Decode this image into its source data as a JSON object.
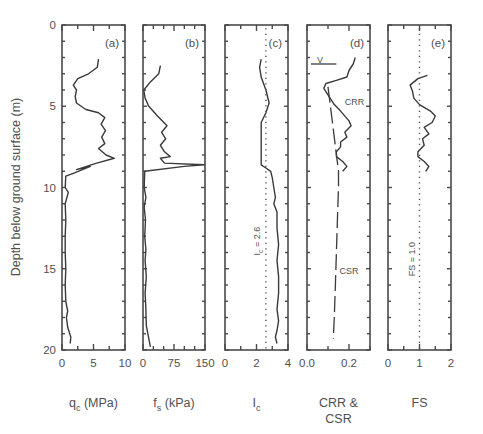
{
  "chart_data": {
    "type": "line",
    "ylabel": "Depth below ground surface  (m)",
    "ylim": [
      0,
      20
    ],
    "yticks": [
      0,
      5,
      10,
      15,
      20
    ],
    "y_inverted": true,
    "panels": [
      {
        "id": "a",
        "panel_label": "(a)",
        "xlabel_main": "q",
        "xlabel_sub": "c",
        "xlabel_unit": "(MPa)",
        "xlim": [
          0,
          10
        ],
        "xticks": [
          0,
          5,
          10
        ],
        "xtick_labels": [
          "0",
          "5",
          "10"
        ],
        "minor_step": 2.5,
        "series": [
          {
            "name": "qc",
            "style": "solid",
            "points": [
              [
                5.8,
                2.1
              ],
              [
                5.6,
                2.6
              ],
              [
                4.2,
                3.0
              ],
              [
                2.5,
                3.3
              ],
              [
                1.8,
                3.7
              ],
              [
                2.3,
                4.0
              ],
              [
                2.1,
                4.4
              ],
              [
                2.3,
                4.8
              ],
              [
                3.8,
                5.2
              ],
              [
                5.8,
                5.4
              ],
              [
                6.8,
                5.7
              ],
              [
                6.2,
                6.1
              ],
              [
                6.9,
                6.5
              ],
              [
                6.3,
                6.9
              ],
              [
                6.8,
                7.3
              ],
              [
                5.8,
                7.6
              ],
              [
                7.0,
                8.0
              ],
              [
                8.3,
                8.2
              ],
              [
                5.5,
                8.5
              ],
              [
                2.3,
                8.9
              ],
              [
                4.5,
                8.7
              ],
              [
                2.0,
                9.1
              ],
              [
                0.6,
                9.3
              ],
              [
                0.5,
                10.0
              ],
              [
                1.0,
                10.3
              ],
              [
                0.5,
                11.0
              ],
              [
                0.6,
                12.0
              ],
              [
                0.5,
                13.0
              ],
              [
                0.5,
                14.0
              ],
              [
                0.6,
                15.0
              ],
              [
                0.5,
                16.0
              ],
              [
                0.6,
                17.0
              ],
              [
                0.9,
                17.6
              ],
              [
                0.7,
                18.0
              ],
              [
                0.9,
                18.6
              ],
              [
                1.4,
                19.2
              ],
              [
                1.3,
                19.6
              ]
            ]
          }
        ]
      },
      {
        "id": "b",
        "panel_label": "(b)",
        "xlabel_main": "f",
        "xlabel_sub": "s",
        "xlabel_unit": "(kPa)",
        "xlim": [
          0,
          150
        ],
        "xticks": [
          0,
          75,
          150
        ],
        "xtick_labels": [
          "0",
          "75",
          "150"
        ],
        "minor_step": 25,
        "series": [
          {
            "name": "fs",
            "style": "solid",
            "points": [
              [
                42,
                2.5
              ],
              [
                38,
                3.0
              ],
              [
                18,
                3.5
              ],
              [
                2,
                4.0
              ],
              [
                5,
                4.5
              ],
              [
                14,
                5.0
              ],
              [
                35,
                5.6
              ],
              [
                58,
                6.2
              ],
              [
                45,
                6.6
              ],
              [
                55,
                7.0
              ],
              [
                42,
                7.4
              ],
              [
                52,
                7.8
              ],
              [
                66,
                8.1
              ],
              [
                42,
                8.2
              ],
              [
                52,
                8.5
              ],
              [
                148,
                8.6
              ],
              [
                100,
                8.7
              ],
              [
                4,
                9.0
              ],
              [
                3,
                10.0
              ],
              [
                7,
                10.6
              ],
              [
                3,
                11.2
              ],
              [
                6,
                12.0
              ],
              [
                4,
                13.0
              ],
              [
                7,
                13.8
              ],
              [
                5,
                14.5
              ],
              [
                8,
                15.5
              ],
              [
                5,
                16.5
              ],
              [
                7,
                17.5
              ],
              [
                8,
                18.5
              ],
              [
                14,
                19.3
              ],
              [
                18,
                19.8
              ]
            ]
          }
        ]
      },
      {
        "id": "c",
        "panel_label": "(c)",
        "xlabel_main": "I",
        "xlabel_sub": "c",
        "xlabel_unit": "",
        "xlim": [
          0,
          4
        ],
        "xticks": [
          0,
          2,
          4
        ],
        "xtick_labels": [
          "0",
          "2",
          "4"
        ],
        "minor_step": 1,
        "annotation": "Ic = 2.6",
        "annotation_main": "I",
        "annotation_sub": "c",
        "annotation_rest": " = 2.6",
        "series": [
          {
            "name": "Ic",
            "style": "solid",
            "points": [
              [
                2.3,
                2.1
              ],
              [
                2.2,
                2.6
              ],
              [
                2.3,
                3.2
              ],
              [
                2.6,
                4.0
              ],
              [
                2.8,
                4.8
              ],
              [
                2.6,
                5.4
              ],
              [
                2.3,
                6.0
              ],
              [
                2.3,
                7.0
              ],
              [
                2.3,
                8.0
              ],
              [
                2.3,
                8.6
              ],
              [
                2.6,
                8.8
              ],
              [
                2.9,
                9.0
              ],
              [
                3.0,
                9.4
              ],
              [
                3.1,
                10.0
              ],
              [
                3.2,
                10.6
              ],
              [
                3.1,
                11.0
              ],
              [
                3.3,
                11.5
              ],
              [
                3.3,
                12.5
              ],
              [
                3.4,
                13.5
              ],
              [
                3.3,
                14.5
              ],
              [
                3.4,
                15.5
              ],
              [
                3.4,
                16.5
              ],
              [
                3.3,
                17.5
              ],
              [
                3.4,
                18.2
              ],
              [
                3.3,
                18.8
              ],
              [
                3.2,
                19.2
              ],
              [
                3.3,
                19.6
              ]
            ]
          },
          {
            "name": "Ic = 2.6 threshold",
            "style": "dotted",
            "points": [
              [
                2.6,
                0.2
              ],
              [
                2.6,
                19.9
              ]
            ]
          }
        ]
      },
      {
        "id": "d",
        "panel_label": "(d)",
        "xlabel_main": "CRR &",
        "xlabel_line2": "CSR",
        "xlim": [
          0.0,
          0.3
        ],
        "xticks": [
          0.0,
          0.2
        ],
        "xtick_labels": [
          "0.0",
          "0.2"
        ],
        "minor_step": 0.1,
        "water_table_label": "V",
        "water_table_depth": 2.4,
        "curve_labels": [
          "CRR",
          "CSR"
        ],
        "series": [
          {
            "name": "CRR",
            "style": "solid",
            "points": [
              [
                0.23,
                2.0
              ],
              [
                0.22,
                2.4
              ],
              [
                0.2,
                2.8
              ],
              [
                0.19,
                3.2
              ],
              [
                0.14,
                3.4
              ],
              [
                0.09,
                3.6
              ],
              [
                0.08,
                3.9
              ],
              [
                0.1,
                4.3
              ],
              [
                0.13,
                4.9
              ],
              [
                0.16,
                5.3
              ],
              [
                0.2,
                5.9
              ],
              [
                0.21,
                6.2
              ],
              [
                0.18,
                6.6
              ],
              [
                0.19,
                6.9
              ],
              [
                0.16,
                7.2
              ],
              [
                0.16,
                7.5
              ],
              [
                0.14,
                7.8
              ],
              [
                0.14,
                8.1
              ],
              [
                0.17,
                8.4
              ],
              [
                0.19,
                8.7
              ],
              [
                0.17,
                9.0
              ]
            ]
          },
          {
            "name": "CSR",
            "style": "dashed",
            "points": [
              [
                0.1,
                3.8
              ],
              [
                0.15,
                9.0
              ],
              [
                0.15,
                10.0
              ],
              [
                0.145,
                12.0
              ],
              [
                0.14,
                14.0
              ],
              [
                0.135,
                16.0
              ],
              [
                0.13,
                18.0
              ],
              [
                0.125,
                19.3
              ]
            ]
          }
        ]
      },
      {
        "id": "e",
        "panel_label": "(e)",
        "xlabel_main": "FS",
        "xlabel_sub": "",
        "xlabel_unit": "",
        "xlim": [
          0,
          2
        ],
        "xticks": [
          0,
          1,
          2
        ],
        "xtick_labels": [
          "0",
          "1",
          "2"
        ],
        "minor_step": 0.5,
        "annotation": "FS = 1.0",
        "series": [
          {
            "name": "FS",
            "style": "solid",
            "points": [
              [
                1.25,
                3.1
              ],
              [
                0.95,
                3.3
              ],
              [
                0.7,
                3.7
              ],
              [
                0.78,
                4.1
              ],
              [
                0.82,
                4.5
              ],
              [
                1.0,
                4.9
              ],
              [
                1.35,
                5.3
              ],
              [
                1.5,
                5.6
              ],
              [
                1.4,
                6.0
              ],
              [
                1.15,
                6.3
              ],
              [
                1.3,
                6.7
              ],
              [
                1.1,
                7.0
              ],
              [
                1.15,
                7.4
              ],
              [
                0.95,
                7.8
              ],
              [
                0.95,
                8.1
              ],
              [
                1.15,
                8.4
              ],
              [
                1.3,
                8.7
              ],
              [
                1.2,
                9.0
              ]
            ]
          },
          {
            "name": "FS = 1.0 threshold",
            "style": "dotted",
            "points": [
              [
                1.0,
                0.2
              ],
              [
                1.0,
                19.9
              ]
            ]
          }
        ]
      }
    ]
  }
}
